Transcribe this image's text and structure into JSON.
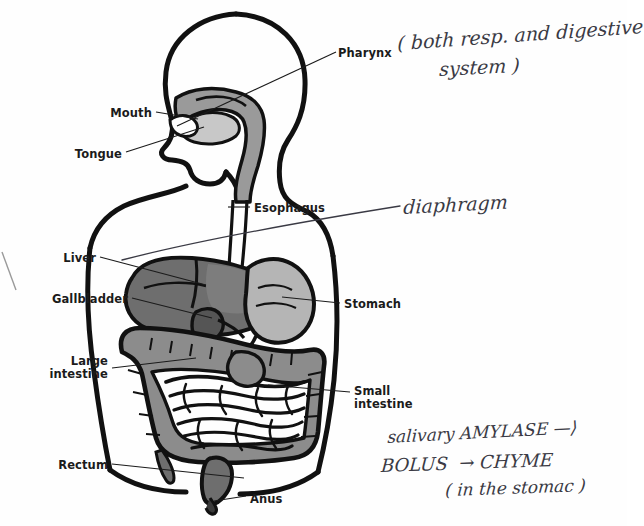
{
  "image": {
    "title": "Human digestive system diagram with handwritten student annotations",
    "canvas": {
      "width": 627,
      "height": 526
    },
    "background_color": "#fefefe",
    "ink_color": "#1b1b1b",
    "handwriting_color": "#3a3a44"
  },
  "palette": {
    "outline": "#111111",
    "organ_dark_gray": "#6e6e6e",
    "organ_mid_gray": "#8c8c8c",
    "organ_light_gray": "#b5b5b5",
    "organ_pale_gray": "#cfcfcf",
    "body_white": "#ffffff"
  },
  "printed_labels": [
    {
      "id": "pharynx",
      "text": "Pharynx",
      "x": 338,
      "y": 47,
      "align": "left"
    },
    {
      "id": "mouth",
      "text": "Mouth",
      "x": 152,
      "y": 107,
      "align": "right"
    },
    {
      "id": "tongue",
      "text": "Tongue",
      "x": 122,
      "y": 148,
      "align": "right"
    },
    {
      "id": "esophagus",
      "text": "Esophagus",
      "x": 254,
      "y": 202,
      "align": "left"
    },
    {
      "id": "liver",
      "text": "Liver",
      "x": 96,
      "y": 252,
      "align": "right"
    },
    {
      "id": "gallbladder",
      "text": "Gallbladder",
      "x": 128,
      "y": 293,
      "align": "right"
    },
    {
      "id": "stomach",
      "text": "Stomach",
      "x": 344,
      "y": 298,
      "align": "left"
    },
    {
      "id": "large-intestine",
      "text": "Large\nintestine",
      "x": 108,
      "y": 355,
      "align": "right"
    },
    {
      "id": "small-intestine",
      "text": "Small\nintestine",
      "x": 354,
      "y": 385,
      "align": "left"
    },
    {
      "id": "rectum",
      "text": "Rectum",
      "x": 108,
      "y": 459,
      "align": "right"
    },
    {
      "id": "anus",
      "text": "Anus",
      "x": 250,
      "y": 493,
      "align": "left"
    }
  ],
  "handwritten_annotations": [
    {
      "id": "pharynx-note-line1",
      "text": "( both resp. and digestive",
      "x": 398,
      "y": 32,
      "size": 19,
      "rotate": -4
    },
    {
      "id": "pharynx-note-line2",
      "text": "system )",
      "x": 440,
      "y": 58,
      "size": 19,
      "rotate": -3
    },
    {
      "id": "diaphragm-note",
      "text": "diaphragm",
      "x": 404,
      "y": 196,
      "size": 19,
      "rotate": -3
    },
    {
      "id": "amylase-note",
      "text": "salivary AMYLASE —⟩",
      "x": 388,
      "y": 427,
      "size": 17,
      "rotate": -3
    },
    {
      "id": "bolus-chyme-note",
      "text": "BOLUS  → CHYME",
      "x": 382,
      "y": 455,
      "size": 18,
      "rotate": -2
    },
    {
      "id": "stomach-note",
      "text": "( in the stomac )",
      "x": 446,
      "y": 480,
      "size": 17,
      "rotate": -2
    }
  ],
  "leader_lines": [
    {
      "id": "pharynx-leader",
      "x1": 336,
      "y1": 52,
      "x2": 177,
      "y2": 126
    },
    {
      "id": "mouth-leader",
      "x1": 156,
      "y1": 112,
      "x2": 198,
      "y2": 119
    },
    {
      "id": "tongue-leader",
      "x1": 126,
      "y1": 152,
      "x2": 204,
      "y2": 127
    },
    {
      "id": "esophagus-leader",
      "x1": 250,
      "y1": 207,
      "x2": 228,
      "y2": 207
    },
    {
      "id": "liver-leader",
      "x1": 100,
      "y1": 257,
      "x2": 206,
      "y2": 285
    },
    {
      "id": "gallbladder-leader",
      "x1": 132,
      "y1": 298,
      "x2": 212,
      "y2": 318
    },
    {
      "id": "stomach-leader",
      "x1": 340,
      "y1": 303,
      "x2": 282,
      "y2": 297
    },
    {
      "id": "large-intestine-leader",
      "x1": 112,
      "y1": 368,
      "x2": 196,
      "y2": 358
    },
    {
      "id": "small-intestine-leader",
      "x1": 350,
      "y1": 392,
      "x2": 268,
      "y2": 385
    },
    {
      "id": "rectum-leader",
      "x1": 112,
      "y1": 464,
      "x2": 244,
      "y2": 478
    },
    {
      "id": "anus-leader",
      "x1": 246,
      "y1": 496,
      "x2": 214,
      "y2": 501
    }
  ],
  "diaphragm_curve": {
    "id": "diaphragm-pen-arc",
    "description": "long handwritten pen arc sweeping from lower-left of torso up to the right margin",
    "path": "M 122 260 C 200 240 300 222 400 206"
  },
  "stray_marks": [
    {
      "id": "stray-mark-left-edge",
      "x1": 2,
      "y1": 252,
      "x2": 16,
      "y2": 290
    }
  ],
  "chart_data": {
    "type": "diagram",
    "parts": [
      "Pharynx",
      "Mouth",
      "Tongue",
      "Esophagus",
      "Liver",
      "Gallbladder",
      "Stomach",
      "Large intestine",
      "Small intestine",
      "Rectum",
      "Anus"
    ]
  }
}
